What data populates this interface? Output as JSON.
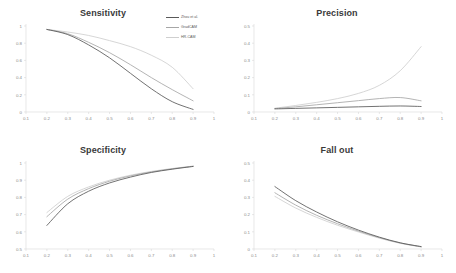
{
  "figure": {
    "background_color": "#ffffff",
    "layout": "2x2 grid of line charts",
    "legend_position": "top-right of Sensitivity panel"
  },
  "legend": {
    "entries": [
      {
        "label": "Zhou et al.",
        "color": "#595959"
      },
      {
        "label": "GradCAM",
        "color": "#a6a6a6"
      },
      {
        "label": "HR-CAM",
        "color": "#cfcfcf"
      }
    ]
  },
  "chart_data": [
    {
      "type": "line",
      "title": "Sensitivity",
      "xlabel": "",
      "ylabel": "",
      "xlim": [
        0.1,
        1.0
      ],
      "ylim": [
        0,
        1.0
      ],
      "grid": false,
      "legend_position": "upper right",
      "xticks": [
        "0.1",
        "0.2",
        "0.3",
        "0.4",
        "0.5",
        "0.6",
        "0.7",
        "0.8",
        "0.9",
        "1"
      ],
      "yticks": [
        "0",
        "0.2",
        "0.4",
        "0.6",
        "0.8",
        "1"
      ],
      "x": [
        0.2,
        0.3,
        0.4,
        0.5,
        0.6,
        0.7,
        0.8,
        0.9
      ],
      "series": [
        {
          "name": "Zhou et al.",
          "color": "#595959",
          "values": [
            0.96,
            0.9,
            0.78,
            0.63,
            0.45,
            0.27,
            0.12,
            0.03
          ]
        },
        {
          "name": "GradCAM",
          "color": "#a6a6a6",
          "values": [
            0.96,
            0.91,
            0.81,
            0.69,
            0.55,
            0.4,
            0.26,
            0.13
          ]
        },
        {
          "name": "HR-CAM",
          "color": "#cfcfcf",
          "values": [
            0.96,
            0.93,
            0.89,
            0.83,
            0.76,
            0.66,
            0.52,
            0.27
          ]
        }
      ]
    },
    {
      "type": "line",
      "title": "Precision",
      "xlabel": "",
      "ylabel": "",
      "xlim": [
        0.1,
        1.0
      ],
      "ylim": [
        0,
        0.5
      ],
      "grid": false,
      "xticks": [
        "0.1",
        "0.2",
        "0.3",
        "0.4",
        "0.5",
        "0.6",
        "0.7",
        "0.8",
        "0.9",
        "1"
      ],
      "yticks": [
        "0",
        "0.1",
        "0.2",
        "0.3",
        "0.4",
        "0.5"
      ],
      "x": [
        0.2,
        0.3,
        0.4,
        0.5,
        0.6,
        0.7,
        0.8,
        0.9
      ],
      "series": [
        {
          "name": "Zhou et al.",
          "color": "#595959",
          "values": [
            0.018,
            0.021,
            0.024,
            0.027,
            0.03,
            0.033,
            0.035,
            0.032
          ]
        },
        {
          "name": "GradCAM",
          "color": "#a6a6a6",
          "values": [
            0.02,
            0.03,
            0.042,
            0.054,
            0.066,
            0.078,
            0.084,
            0.065
          ]
        },
        {
          "name": "HR-CAM",
          "color": "#cfcfcf",
          "values": [
            0.022,
            0.038,
            0.056,
            0.078,
            0.108,
            0.155,
            0.24,
            0.38
          ]
        }
      ]
    },
    {
      "type": "line",
      "title": "Specificity",
      "xlabel": "",
      "ylabel": "",
      "xlim": [
        0.1,
        1.0
      ],
      "ylim": [
        0.5,
        1.0
      ],
      "grid": false,
      "xticks": [
        "0.1",
        "0.2",
        "0.3",
        "0.4",
        "0.5",
        "0.6",
        "0.7",
        "0.8",
        "0.9",
        "1"
      ],
      "yticks": [
        "0.5",
        "0.6",
        "0.7",
        "0.8",
        "0.9",
        "1"
      ],
      "x": [
        0.2,
        0.3,
        0.4,
        0.5,
        0.6,
        0.7,
        0.8,
        0.9
      ],
      "series": [
        {
          "name": "Zhou et al.",
          "color": "#595959",
          "values": [
            0.637,
            0.763,
            0.836,
            0.884,
            0.918,
            0.945,
            0.964,
            0.98
          ]
        },
        {
          "name": "GradCAM",
          "color": "#a6a6a6",
          "values": [
            0.688,
            0.79,
            0.851,
            0.894,
            0.925,
            0.948,
            0.966,
            0.981
          ]
        },
        {
          "name": "HR-CAM",
          "color": "#cfcfcf",
          "values": [
            0.712,
            0.806,
            0.861,
            0.9,
            0.929,
            0.951,
            0.968,
            0.982
          ]
        }
      ]
    },
    {
      "type": "line",
      "title": "Fall out",
      "xlabel": "",
      "ylabel": "",
      "xlim": [
        0.1,
        1.0
      ],
      "ylim": [
        0,
        0.5
      ],
      "grid": false,
      "xticks": [
        "0.1",
        "0.2",
        "0.3",
        "0.4",
        "0.5",
        "0.6",
        "0.7",
        "0.8",
        "0.9",
        "1"
      ],
      "yticks": [
        "0",
        "0.1",
        "0.2",
        "0.3",
        "0.4",
        "0.5"
      ],
      "x": [
        0.2,
        0.3,
        0.4,
        0.5,
        0.6,
        0.7,
        0.8,
        0.9
      ],
      "series": [
        {
          "name": "Zhou et al.",
          "color": "#595959",
          "values": [
            0.363,
            0.281,
            0.215,
            0.158,
            0.11,
            0.069,
            0.036,
            0.014
          ]
        },
        {
          "name": "GradCAM",
          "color": "#a6a6a6",
          "values": [
            0.327,
            0.255,
            0.196,
            0.147,
            0.104,
            0.066,
            0.035,
            0.013
          ]
        },
        {
          "name": "HR-CAM",
          "color": "#cfcfcf",
          "values": [
            0.306,
            0.238,
            0.184,
            0.138,
            0.099,
            0.063,
            0.033,
            0.012
          ]
        }
      ]
    }
  ]
}
